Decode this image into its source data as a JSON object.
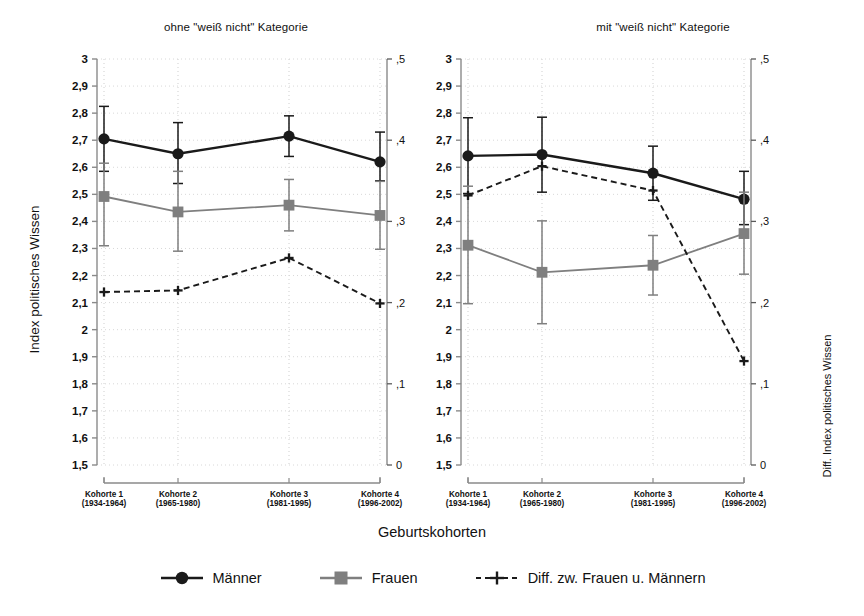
{
  "figure": {
    "xlabel": "Geburtskohorten",
    "ylabel_left": "Index politisches Wissen",
    "ylabel_right": "Diff. Index politisches Wissen"
  },
  "legend": {
    "items": [
      {
        "label": "Männer",
        "marker": "filled-circle",
        "line": "solid",
        "color": "#1a1a1a"
      },
      {
        "label": "Frauen",
        "marker": "filled-square",
        "line": "solid",
        "color": "#7f7f7f"
      },
      {
        "label": "Diff. zw. Frauen u. Männern",
        "marker": "plus",
        "line": "dashed",
        "color": "#1a1a1a"
      }
    ]
  },
  "categories": [
    {
      "line1": "Kohorte 1",
      "line2": "(1934-1964)"
    },
    {
      "line1": "Kohorte 2",
      "line2": "(1965-1980)"
    },
    {
      "line1": "Kohorte 3",
      "line2": "(1981-1995)"
    },
    {
      "line1": "Kohorte 4",
      "line2": "(1996-2002)"
    }
  ],
  "axis": {
    "left_ticks": [
      "3",
      "2,9",
      "2,8",
      "2,7",
      "2,6",
      "2,5",
      "2,4",
      "2,3",
      "2,2",
      "2,1",
      "2",
      "1,9",
      "1,8",
      "1,7",
      "1,6",
      "1,5"
    ],
    "left_values": [
      3,
      2.9,
      2.8,
      2.7,
      2.6,
      2.5,
      2.4,
      2.3,
      2.2,
      2.1,
      2.0,
      1.9,
      1.8,
      1.7,
      1.6,
      1.5
    ],
    "right_ticks": [
      ",5",
      ",4",
      ",3",
      ",2",
      ",1",
      "0"
    ],
    "right_values": [
      0.5,
      0.4,
      0.3,
      0.2,
      0.1,
      0.0
    ],
    "ylim_left": [
      1.5,
      3.0
    ],
    "ylim_right": [
      0.0,
      0.5
    ]
  },
  "chart_data": [
    {
      "type": "line",
      "title": "ohne \"weiß nicht\" Kategorie",
      "xlabel": "Geburtskohorten",
      "ylabel": "Index politisches Wissen",
      "ylabel_secondary": "Diff. Index politisches Wissen",
      "categories": [
        "Kohorte 1 (1934-1964)",
        "Kohorte 2 (1965-1980)",
        "Kohorte 3 (1981-1995)",
        "Kohorte 4 (1996-2002)"
      ],
      "ylim": [
        1.5,
        3.0
      ],
      "ylim_secondary": [
        0.0,
        0.5
      ],
      "grid": true,
      "legend_position": "bottom",
      "series": [
        {
          "name": "Männer",
          "axis": "left",
          "marker": "filled-circle",
          "color": "#1a1a1a",
          "values": [
            2.705,
            2.65,
            2.715,
            2.62
          ],
          "ci_low": [
            2.585,
            2.54,
            2.64,
            2.55
          ],
          "ci_high": [
            2.825,
            2.765,
            2.79,
            2.73
          ]
        },
        {
          "name": "Frauen",
          "axis": "left",
          "marker": "filled-square",
          "color": "#7f7f7f",
          "values": [
            2.492,
            2.435,
            2.46,
            2.422
          ],
          "ci_low": [
            2.31,
            2.29,
            2.365,
            2.297
          ],
          "ci_high": [
            2.615,
            2.585,
            2.555,
            2.548
          ]
        },
        {
          "name": "Diff. zw. Frauen u. Männern",
          "axis": "right",
          "marker": "plus",
          "line": "dashed",
          "color": "#1a1a1a",
          "values": [
            0.213,
            0.215,
            0.255,
            0.199
          ]
        }
      ]
    },
    {
      "type": "line",
      "title": "mit \"weiß nicht\" Kategorie",
      "xlabel": "Geburtskohorten",
      "ylabel": "Index politisches Wissen",
      "ylabel_secondary": "Diff. Index politisches Wissen",
      "categories": [
        "Kohorte 1 (1934-1964)",
        "Kohorte 2 (1965-1980)",
        "Kohorte 3 (1981-1995)",
        "Kohorte 4 (1996-2002)"
      ],
      "ylim": [
        1.5,
        3.0
      ],
      "ylim_secondary": [
        0.0,
        0.5
      ],
      "grid": true,
      "legend_position": "bottom",
      "series": [
        {
          "name": "Männer",
          "axis": "left",
          "marker": "filled-circle",
          "color": "#1a1a1a",
          "values": [
            2.642,
            2.647,
            2.578,
            2.482
          ],
          "ci_low": [
            2.503,
            2.508,
            2.478,
            2.388
          ],
          "ci_high": [
            2.783,
            2.785,
            2.678,
            2.585
          ]
        },
        {
          "name": "Frauen",
          "axis": "left",
          "marker": "filled-square",
          "color": "#7f7f7f",
          "values": [
            2.312,
            2.212,
            2.238,
            2.355
          ],
          "ci_low": [
            2.096,
            2.022,
            2.128,
            2.205
          ],
          "ci_high": [
            2.53,
            2.402,
            2.348,
            2.508
          ]
        },
        {
          "name": "Diff. zw. Frauen u. Männern",
          "axis": "right",
          "marker": "plus",
          "line": "dashed",
          "color": "#1a1a1a",
          "values": [
            0.332,
            0.368,
            0.338,
            0.128
          ]
        }
      ]
    }
  ]
}
